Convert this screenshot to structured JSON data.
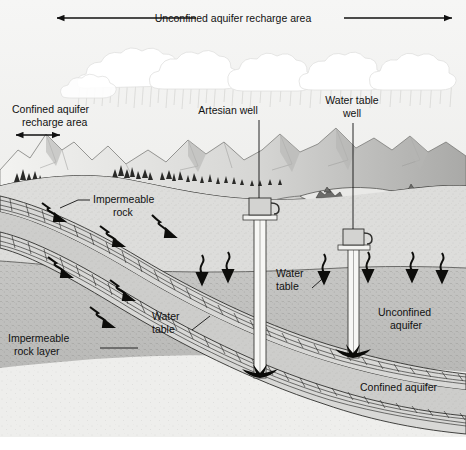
{
  "figure": {
    "width": 466,
    "height": 450
  },
  "banner": {
    "label": "Unconfined aquifer recharge area"
  },
  "labels": {
    "confined_recharge_line1": "Confined aquifer",
    "confined_recharge_line2": "recharge area",
    "artesian_well": "Artesian well",
    "water_table_well_line1": "Water table",
    "water_table_well_line2": "well",
    "impermeable_rock_line1": "Impermeable",
    "impermeable_rock_line2": "rock",
    "impermeable_rock_layer_line1": "Impermeable",
    "impermeable_rock_layer_line2": "rock layer",
    "water_table_left_line1": "Water",
    "water_table_left_line2": "table",
    "water_table_center_line1": "Water",
    "water_table_center_line2": "table",
    "unconfined_aquifer_line1": "Unconfined",
    "unconfined_aquifer_line2": "aquifer",
    "confined_aquifer": "Confined aquifer"
  },
  "colors": {
    "sky": "#f2f2f0",
    "cloud": "#ffffff",
    "mountain_light": "#e8e8e6",
    "mountain_shade": "#bdbdbb",
    "ground_surface": "#cfcfcc",
    "vadose_zone": "#dedede",
    "saturated_zone": "#c2c2c0",
    "deep_rock": "#e6e6e4",
    "lake": "#e2e2e0",
    "ink": "#111111",
    "line": "#3a3a3a"
  }
}
